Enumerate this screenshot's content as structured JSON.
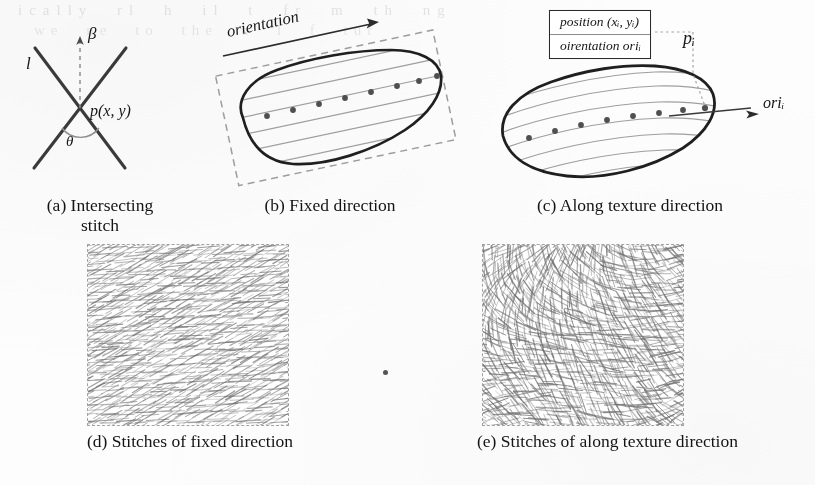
{
  "figure": {
    "ghost_bleed_line1": "ically  rl  h  il  t  fr m  th  ng",
    "ghost_bleed_line2": "we  ne  to  the  u  l  f  tur"
  },
  "panels": [
    {
      "id": "a",
      "caption": "(a) Intersecting\nstitch",
      "labels": {
        "line": "l",
        "beta": "β",
        "point": "p(x, y)",
        "theta": "θ"
      }
    },
    {
      "id": "b",
      "caption": "(b) Fixed direction",
      "labels": {
        "orientation": "orientation"
      }
    },
    {
      "id": "c",
      "caption": "(c) Along texture direction",
      "labels": {
        "position_row": "position  (xᵢ, yᵢ)",
        "orientation_row": "oirentation  oriᵢ",
        "point": "pᵢ",
        "ori": "oriᵢ"
      },
      "infobox": {
        "row1_prefix": "position",
        "row1_value": "(x",
        "row1_sub1": "i",
        "row1_mid": ", y",
        "row1_sub2": "i",
        "row1_suffix": ")",
        "row2_prefix": "oirentation",
        "row2_value": "ori",
        "row2_sub": "i"
      }
    },
    {
      "id": "d",
      "caption": "(d) Stitches of fixed direction"
    },
    {
      "id": "e",
      "caption": "(e) Stitches of along texture direction"
    }
  ],
  "captions": {
    "a": "(a) Intersecting\nstitch",
    "b": "(b) Fixed direction",
    "c": "(c) Along texture direction",
    "d": "(d) Stitches of fixed direction",
    "e": "(e) Stitches of along texture direction"
  },
  "colors": {
    "ink": "#1b1b1b",
    "outline": "#262626",
    "hatch": "#8a8a8a",
    "dashed": "#9a9a9a",
    "paper": "#fdfdfc",
    "dot": "#4a4a4a"
  },
  "chart_data": {
    "type": "diagram",
    "panel_a": {
      "description": "Two crossing straight stitch lines forming an X, intersection point p(x,y), vertical dashed reference axis labelled beta, crossing angle theta below the intersection, left line labelled l",
      "intersection_point": [
        80,
        105
      ],
      "crossing_angle_theta_deg": 76,
      "beta_axis_angle_deg": 90,
      "line_labels": [
        "l",
        "β",
        "p(x, y)",
        "θ"
      ]
    },
    "panel_b": {
      "description": "Closed blob region with a rotated dashed bounding box; parallel straight scan lines at the fixed orientation fill the blob; sample stitch points marked as dots along one scan line; an arrow labelled 'orientation' shows the fixed direction",
      "bounding_box_rotation_deg": -12,
      "scan_line_count": 7,
      "scan_line_angle_deg": -12,
      "sample_point_count": 8,
      "arrow_label": "orientation"
    },
    "panel_c": {
      "description": "Same blob region filled with curved flow lines that follow the texture direction; sample stitch points along the central flow line; a callout box lists the per-point attributes; point p_i on the right edge with its local orientation vector ori_i",
      "flow_line_count": 7,
      "sample_point_count": 9,
      "callout_rows": [
        "position  (xᵢ, yᵢ)",
        "oirentation  oriᵢ"
      ],
      "highlighted_point": "pᵢ",
      "orientation_vector": "oriᵢ"
    },
    "panel_d": {
      "description": "Rendered embroidery texture patch: dense short stitches all at one fixed diagonal angle, producing a uniform regular weave",
      "patch_rect": [
        88,
        245,
        200,
        180
      ],
      "stitch_angle_deg": -30,
      "angle_variation_deg": 6,
      "stitch_count": 900,
      "uniformity": "high"
    },
    "panel_e": {
      "description": "Rendered embroidery texture patch: stitches follow a spatially varying texture direction field, producing swirling non-uniform weave",
      "patch_rect": [
        483,
        245,
        200,
        180
      ],
      "stitch_angle_deg": "varies",
      "angle_variation_deg": 75,
      "stitch_count": 900,
      "uniformity": "low"
    }
  }
}
